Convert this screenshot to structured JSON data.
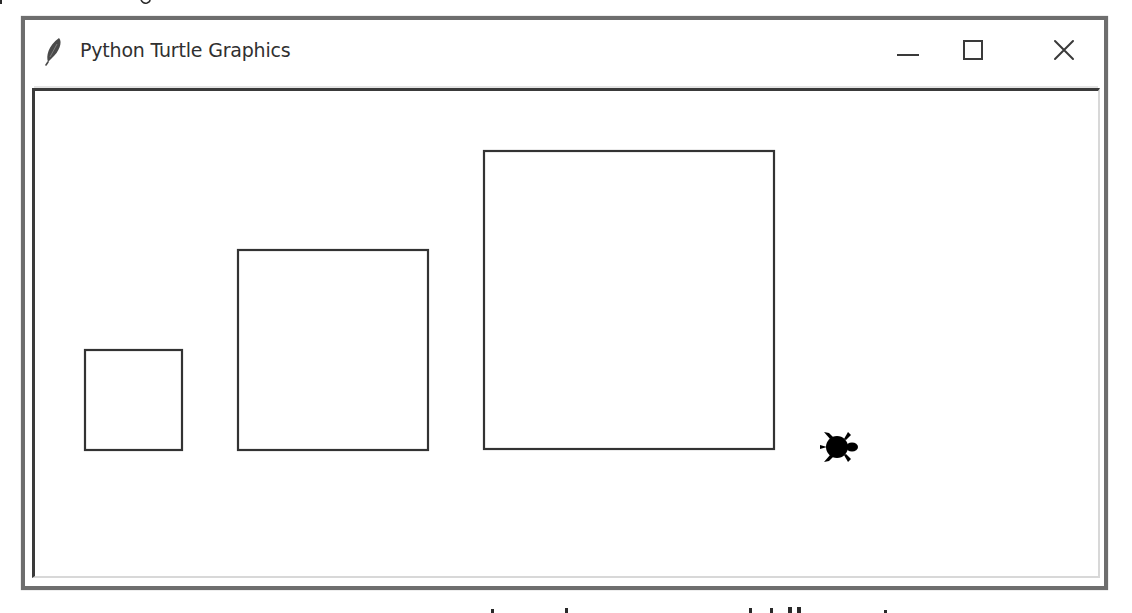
{
  "window": {
    "title": "Python Turtle Graphics",
    "app_icon": "feather-icon",
    "controls": {
      "minimize": "minimize-icon",
      "maximize": "maximize-icon",
      "close": "close-icon"
    },
    "colors": {
      "frame": "#6e6e6e",
      "title_text": "#303030",
      "canvas_bg": "#ffffff",
      "stroke": "#333333",
      "turtle": "#000000"
    }
  },
  "canvas": {
    "shapes": [
      {
        "type": "square",
        "name": "small-square",
        "x": 77,
        "y": 345,
        "size": 98
      },
      {
        "type": "square",
        "name": "medium-square",
        "x": 230,
        "y": 246,
        "size": 191
      },
      {
        "type": "square",
        "name": "large-square",
        "x": 477,
        "y": 147,
        "size": 290
      }
    ],
    "turtle": {
      "shape": "turtle",
      "x": 832,
      "y": 443,
      "heading": "east"
    }
  }
}
